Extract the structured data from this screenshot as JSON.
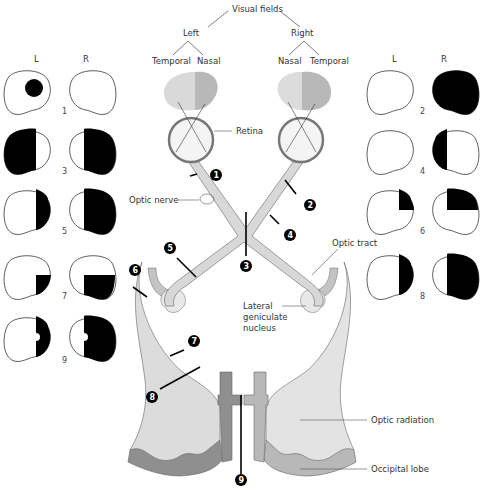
{
  "header": {
    "visual_fields": "Visual fields",
    "left": "Left",
    "right": "Right",
    "left_temporal": "Temporal",
    "left_nasal": "Nasal",
    "right_nasal": "Nasal",
    "right_temporal": "Temporal"
  },
  "labels": {
    "retina": "Retina",
    "optic_nerve": "Optic nerve",
    "optic_tract": "Optic tract",
    "lgn_1": "Lateral",
    "lgn_2": "geniculate",
    "lgn_3": "nucleus",
    "optic_radiation": "Optic radiation",
    "occipital_lobe": "Occipital lobe"
  },
  "field_eye_labels": {
    "left": "L",
    "right": "R"
  },
  "defects": [
    {
      "id": "1",
      "label": "1",
      "left": "central scotoma",
      "right": "normal"
    },
    {
      "id": "2",
      "label": "2",
      "left": "normal",
      "right": "full blind"
    },
    {
      "id": "3",
      "label": "3",
      "left": "temporal half blind",
      "right": "temporal half blind"
    },
    {
      "id": "4",
      "label": "4",
      "left": "normal",
      "right": "nasal half blind"
    },
    {
      "id": "5",
      "label": "5",
      "left": "nasal half blind",
      "right": "temporal half blind"
    },
    {
      "id": "6",
      "label": "6",
      "left": "upper nasal quadrant",
      "right": "upper temporal quadrant"
    },
    {
      "id": "7",
      "label": "7",
      "left": "lower nasal quadrant",
      "right": "lower temporal quadrant"
    },
    {
      "id": "8",
      "label": "8",
      "left": "nasal half blind",
      "right": "temporal half blind"
    },
    {
      "id": "9",
      "label": "9",
      "left": "nasal half with macular sparing",
      "right": "temporal half with macular sparing"
    }
  ],
  "lesion_badges": [
    "1",
    "2",
    "3",
    "4",
    "5",
    "6",
    "7",
    "8",
    "9"
  ],
  "colors": {
    "pathway_light": "#dcdcdc",
    "pathway_mid": "#c4c4c4",
    "pathway_dark": "#8f8f8f",
    "field_temporal": "#d9d9d9",
    "field_nasal": "#b8b8b8",
    "lesion": "#000000"
  }
}
